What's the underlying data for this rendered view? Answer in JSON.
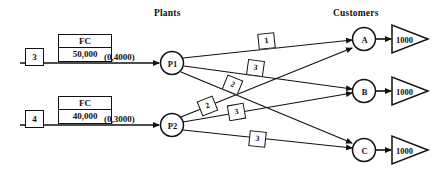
{
  "headers": {
    "plants": "Plants",
    "customers": "Customers"
  },
  "sources": [
    {
      "id": "src-1",
      "number": "3",
      "fc_label": "FC",
      "fc_value": "50,000",
      "capacity": "(0,4000)",
      "plant": "P1"
    },
    {
      "id": "src-2",
      "number": "4",
      "fc_label": "FC",
      "fc_value": "40,000",
      "capacity": "(0,3000)",
      "plant": "P2"
    }
  ],
  "plants": [
    {
      "id": "P1",
      "label": "P1"
    },
    {
      "id": "P2",
      "label": "P2"
    }
  ],
  "customers": [
    {
      "id": "A",
      "label": "A",
      "demand": "1000"
    },
    {
      "id": "B",
      "label": "B",
      "demand": "1000"
    },
    {
      "id": "C",
      "label": "C",
      "demand": "1000"
    }
  ],
  "arcs": [
    {
      "from": "P1",
      "to": "A",
      "cost": "1"
    },
    {
      "from": "P1",
      "to": "B",
      "cost": "3"
    },
    {
      "from": "P1",
      "to": "C",
      "cost": "2"
    },
    {
      "from": "P2",
      "to": "A",
      "cost": "2"
    },
    {
      "from": "P2",
      "to": "B",
      "cost": "3"
    },
    {
      "from": "P2",
      "to": "C",
      "cost": "3"
    }
  ],
  "colors": {
    "ink": "#111111",
    "paper": "#ffffff"
  }
}
